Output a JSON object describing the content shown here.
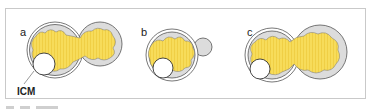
{
  "figure": {
    "panels": [
      {
        "label": "a",
        "stage": "partially hatched, small herniation"
      },
      {
        "label": "b",
        "stage": "early herniation through zona"
      },
      {
        "label": "c",
        "stage": "hatching, large herniation"
      }
    ],
    "annotations": {
      "icm": "ICM"
    },
    "colors": {
      "cavity": "#f7dc5a",
      "trophectoderm": "#dcdcdc",
      "zona_outline": "#555555",
      "frame": "#c9c9c9"
    }
  }
}
